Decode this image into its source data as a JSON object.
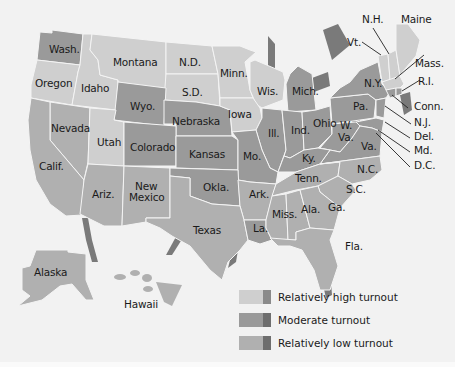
{
  "map": {
    "title": "Voter turnout by state",
    "states": [
      {
        "name": "Wash.",
        "turnout": "moderate"
      },
      {
        "name": "Oregon",
        "turnout": "high"
      },
      {
        "name": "Idaho",
        "turnout": "high"
      },
      {
        "name": "Montana",
        "turnout": "high"
      },
      {
        "name": "N.D.",
        "turnout": "high"
      },
      {
        "name": "Minn.",
        "turnout": "high"
      },
      {
        "name": "Wis.",
        "turnout": "high"
      },
      {
        "name": "Mich.",
        "turnout": "moderate"
      },
      {
        "name": "S.D.",
        "turnout": "high"
      },
      {
        "name": "Wyo.",
        "turnout": "moderate"
      },
      {
        "name": "Nebraska",
        "turnout": "moderate"
      },
      {
        "name": "Iowa",
        "turnout": "high"
      },
      {
        "name": "Ill.",
        "turnout": "moderate"
      },
      {
        "name": "Ind.",
        "turnout": "moderate"
      },
      {
        "name": "Ohio",
        "turnout": "moderate"
      },
      {
        "name": "Nevada",
        "turnout": "low"
      },
      {
        "name": "Utah",
        "turnout": "high"
      },
      {
        "name": "Colorado",
        "turnout": "moderate"
      },
      {
        "name": "Kansas",
        "turnout": "moderate"
      },
      {
        "name": "Mo.",
        "turnout": "moderate"
      },
      {
        "name": "Ky.",
        "turnout": "moderate"
      },
      {
        "name": "W. Va.",
        "turnout": "moderate"
      },
      {
        "name": "Va.",
        "turnout": "moderate"
      },
      {
        "name": "Calif.",
        "turnout": "low"
      },
      {
        "name": "Ariz.",
        "turnout": "low"
      },
      {
        "name": "New Mexico",
        "turnout": "low"
      },
      {
        "name": "Okla.",
        "turnout": "moderate"
      },
      {
        "name": "Ark.",
        "turnout": "low"
      },
      {
        "name": "Tenn.",
        "turnout": "low"
      },
      {
        "name": "N.C.",
        "turnout": "low"
      },
      {
        "name": "S.C.",
        "turnout": "low"
      },
      {
        "name": "Texas",
        "turnout": "low"
      },
      {
        "name": "La.",
        "turnout": "moderate"
      },
      {
        "name": "Miss.",
        "turnout": "low"
      },
      {
        "name": "Ala.",
        "turnout": "low"
      },
      {
        "name": "Ga.",
        "turnout": "low"
      },
      {
        "name": "Fla.",
        "turnout": "low"
      },
      {
        "name": "N.Y.",
        "turnout": "moderate"
      },
      {
        "name": "Pa.",
        "turnout": "moderate"
      },
      {
        "name": "Vt.",
        "turnout": "high"
      },
      {
        "name": "N.H.",
        "turnout": "high"
      },
      {
        "name": "Maine",
        "turnout": "high"
      },
      {
        "name": "Mass.",
        "turnout": "high"
      },
      {
        "name": "R.I.",
        "turnout": "moderate"
      },
      {
        "name": "Conn.",
        "turnout": "moderate"
      },
      {
        "name": "N.J.",
        "turnout": "moderate"
      },
      {
        "name": "Del.",
        "turnout": "moderate"
      },
      {
        "name": "Md.",
        "turnout": "moderate"
      },
      {
        "name": "D.C.",
        "turnout": "low"
      },
      {
        "name": "Alaska",
        "turnout": "low"
      },
      {
        "name": "Hawaii",
        "turnout": "low"
      }
    ],
    "labels": {
      "wash": "Wash.",
      "oregon": "Oregon",
      "idaho": "Idaho",
      "montana": "Montana",
      "nd": "N.D.",
      "minn": "Minn.",
      "wis": "Wis.",
      "mich": "Mich.",
      "sd": "S.D.",
      "wyo": "Wyo.",
      "nebraska": "Nebraska",
      "iowa": "Iowa",
      "ill": "Ill.",
      "ind": "Ind.",
      "ohio": "Ohio",
      "nevada": "Nevada",
      "utah": "Utah",
      "colorado": "Colorado",
      "kansas": "Kansas",
      "mo": "Mo.",
      "ky": "Ky.",
      "wva_1": "W.",
      "wva_2": "Va.",
      "va": "Va.",
      "calif": "Calif.",
      "ariz": "Ariz.",
      "nm_1": "New",
      "nm_2": "Mexico",
      "okla": "Okla.",
      "ark": "Ark.",
      "tenn": "Tenn.",
      "nc": "N.C.",
      "sc": "S.C.",
      "texas": "Texas",
      "la": "La.",
      "miss": "Miss.",
      "ala": "Ala.",
      "ga": "Ga.",
      "fla": "Fla.",
      "ny": "N.Y.",
      "pa": "Pa.",
      "vt": "Vt.",
      "nh": "N.H.",
      "maine": "Maine",
      "mass": "Mass.",
      "ri": "R.I.",
      "conn": "Conn.",
      "nj": "N.J.",
      "del": "Del.",
      "md": "Md.",
      "dc": "D.C.",
      "alaska": "Alaska",
      "hawaii": "Hawaii"
    }
  },
  "legend": {
    "items": [
      {
        "label": "Relatively high turnout",
        "color": "#cfcfcf",
        "edge": "#8a8a8a"
      },
      {
        "label": "Moderate turnout",
        "color": "#9a9a9a",
        "edge": "#6e6e6e"
      },
      {
        "label": "Relatively low turnout",
        "color": "#b0b0b0",
        "edge": "#6e6e6e"
      }
    ]
  },
  "colors": {
    "background": "#f2f2f2",
    "high": "#cfcfcf",
    "moderate": "#9a9a9a",
    "low": "#b0b0b0",
    "shadow": "#7a7a7a"
  }
}
